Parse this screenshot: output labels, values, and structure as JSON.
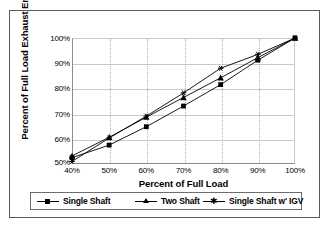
{
  "figure": {
    "background": "#ffffff",
    "frame_color": "#5a5a5a",
    "series_color": "#000000",
    "grid_color": "#c9c9c9"
  },
  "chart_data": {
    "type": "line",
    "title": "",
    "xlabel": "Percent of Full Load",
    "ylabel": "Percent of Full Load Exhaust Energy",
    "x": [
      40,
      50,
      60,
      70,
      80,
      90,
      100
    ],
    "categories": [
      "40%",
      "50%",
      "60%",
      "70%",
      "80%",
      "90%",
      "100%"
    ],
    "xtick_labels": [
      "40%",
      "50%",
      "60%",
      "70%",
      "80%",
      "90%",
      "100%"
    ],
    "ytick_labels": [
      "50%",
      "60%",
      "70%",
      "80%",
      "90%",
      "100%"
    ],
    "xlim": [
      40,
      100
    ],
    "ylim": [
      50,
      100
    ],
    "grid": true,
    "grid_horizontal": "solid",
    "grid_vertical": "dotted",
    "legend_position": "bottom",
    "series": [
      {
        "name": "Single Shaft",
        "marker": "square",
        "values": [
          52.5,
          57.5,
          64.8,
          73.0,
          81.5,
          91.2,
          100
        ]
      },
      {
        "name": "Two Shaft",
        "marker": "triangle",
        "values": [
          53.2,
          60.6,
          68.6,
          76.4,
          84.2,
          92.2,
          100
        ]
      },
      {
        "name": "Single Shaft w' IGV",
        "marker": "star",
        "values": [
          51.0,
          60.3,
          69.0,
          78.2,
          88.0,
          93.5,
          100
        ]
      }
    ]
  },
  "legend": {
    "items": [
      {
        "label": "Single Shaft",
        "marker": "square-marker-icon"
      },
      {
        "label": "Two Shaft",
        "marker": "triangle-marker-icon"
      },
      {
        "label": "Single Shaft w' IGV",
        "marker": "star-marker-icon"
      }
    ]
  }
}
